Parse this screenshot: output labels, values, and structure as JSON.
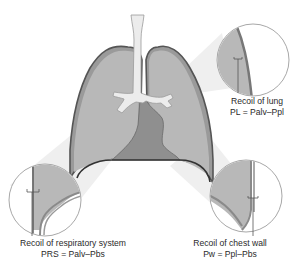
{
  "figure": {
    "colors": {
      "lung_fill": "#b8b8b8",
      "lung_outline": "#555555",
      "pleura": "#8a8a8a",
      "heart_fill": "#8f8f8f",
      "airway_fill": "#ececec",
      "callout_beam": "#efefef",
      "magnifier_border": "#a8a8a8"
    },
    "labels": {
      "lung": {
        "title": "Recoil of lung",
        "formula": "PL = Palv–Ppl"
      },
      "respiratory_system": {
        "title": "Recoil of respiratory system",
        "formula": "PRS = Palv–Pbs"
      },
      "chest_wall": {
        "title": "Recoil of chest wall",
        "formula": "Pw = Ppl–Pbs"
      }
    }
  }
}
